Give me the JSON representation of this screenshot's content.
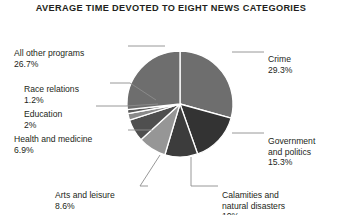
{
  "chart_data": {
    "type": "pie",
    "title": "AVERAGE TIME DEVOTED TO EIGHT NEWS CATEGORIES",
    "xlabel": "",
    "ylabel": "",
    "grid": false,
    "legend": "none",
    "label_style": "leader-lines",
    "start_angle_deg": 0,
    "direction": "clockwise",
    "units": "percent",
    "categories": [
      "Crime",
      "Government and politics",
      "Calamities and natural disasters",
      "Arts and leisure",
      "Health and medicine",
      "Education",
      "Race relations",
      "All other programs"
    ],
    "values": [
      29.3,
      15.3,
      10,
      8.6,
      6.9,
      2,
      1.2,
      26.7
    ],
    "value_labels": [
      "29.3%",
      "15.3%",
      "10%",
      "8.6%",
      "6.9%",
      "2%",
      "1.2%",
      "26.7%"
    ],
    "slice_colors": [
      "#6e6e6e",
      "#333333",
      "#3c3c3c",
      "#969696",
      "#4f4f4f",
      "#8a8a8a",
      "#5a5a5a",
      "#6e6e6e"
    ],
    "slice_border_color": "#ffffff",
    "background_color": "#ffffff",
    "text_color": "#231f20",
    "slices": [
      {
        "label": "Crime",
        "value": 29.3,
        "value_label": "29.3%",
        "color": "#6e6e6e"
      },
      {
        "label": "Government and politics",
        "value": 15.3,
        "value_label": "15.3%",
        "color": "#333333"
      },
      {
        "label": "Calamities and natural disasters",
        "value": 10,
        "value_label": "10%",
        "color": "#3c3c3c"
      },
      {
        "label": "Arts and leisure",
        "value": 8.6,
        "value_label": "8.6%",
        "color": "#969696"
      },
      {
        "label": "Health and medicine",
        "value": 6.9,
        "value_label": "6.9%",
        "color": "#4f4f4f"
      },
      {
        "label": "Education",
        "value": 2,
        "value_label": "2%",
        "color": "#8a8a8a"
      },
      {
        "label": "Race relations",
        "value": 1.2,
        "value_label": "1.2%",
        "color": "#5a5a5a"
      },
      {
        "label": "All other programs",
        "value": 26.7,
        "value_label": "26.7%",
        "color": "#6e6e6e"
      }
    ]
  },
  "labels": {
    "all_other_programs": {
      "name": "All other programs",
      "pct": "26.7%"
    },
    "race_relations": {
      "name": "Race relations",
      "pct": "1.2%"
    },
    "education": {
      "name": "Education",
      "pct": "2%"
    },
    "health_and_medicine": {
      "name": "Health and medicine",
      "pct": "6.9%"
    },
    "arts_and_leisure": {
      "name": "Arts and leisure",
      "pct": "8.6%"
    },
    "crime": {
      "name": "Crime",
      "pct": "29.3%"
    },
    "government_and_politics": {
      "name": "Government\nand politics",
      "pct": "15.3%"
    },
    "calamities": {
      "name": "Calamities and\nnatural disasters",
      "pct": "10%"
    }
  }
}
